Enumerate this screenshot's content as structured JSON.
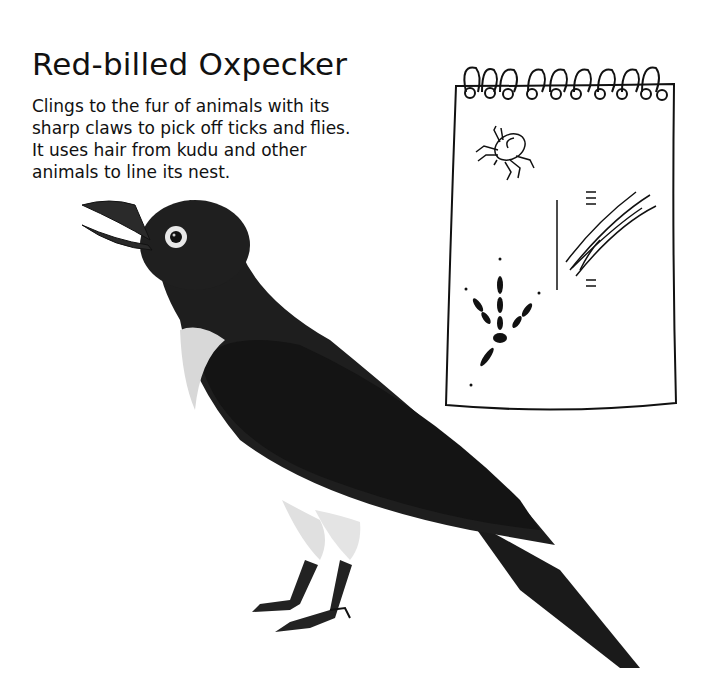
{
  "page": {
    "title": "Red-billed Oxpecker",
    "description_lines": [
      "Clings to the fur of animals with its",
      "sharp claws to pick off ticks and flies.",
      "It uses hair from kudu and other",
      "animals to line its nest."
    ]
  },
  "illustrations": {
    "bird": {
      "icon": "oxpecker-bird-illustration",
      "body_color": "#1c1c1c",
      "throat_color": "#d8d8d8"
    },
    "notebook": {
      "icon": "spiral-notebook-sketch",
      "sketches": [
        "tick-icon",
        "hair-in-bark-icon",
        "bird-footprint-icon"
      ]
    }
  }
}
